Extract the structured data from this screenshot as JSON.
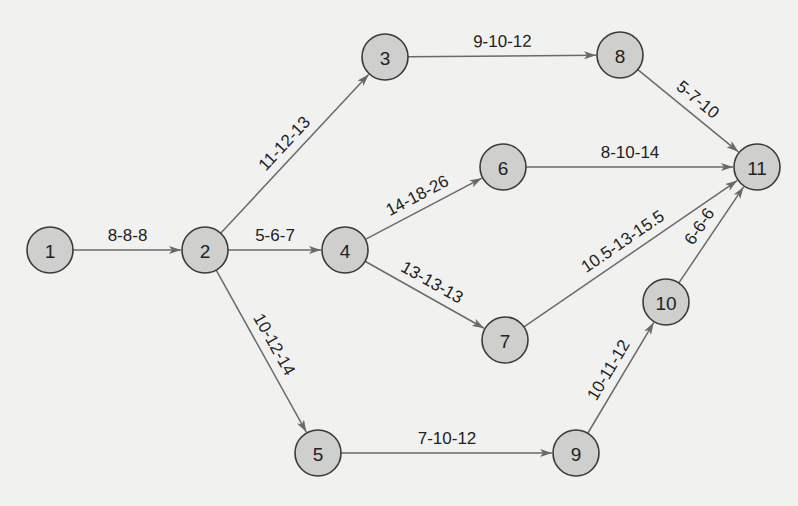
{
  "diagram": {
    "type": "activity-on-arrow network (PERT)",
    "colors": {
      "background": "#f1f1ef",
      "node_fill": "#cfcfcd",
      "node_stroke": "#3a3a3a",
      "edge": "#6a6a6a",
      "text": "#222222"
    },
    "node_radius": 23,
    "nodes": [
      {
        "id": "1",
        "label": "1",
        "x": 50,
        "y": 250
      },
      {
        "id": "2",
        "label": "2",
        "x": 205,
        "y": 250
      },
      {
        "id": "3",
        "label": "3",
        "x": 385,
        "y": 57
      },
      {
        "id": "4",
        "label": "4",
        "x": 345,
        "y": 250
      },
      {
        "id": "5",
        "label": "5",
        "x": 318,
        "y": 453
      },
      {
        "id": "6",
        "label": "6",
        "x": 503,
        "y": 167
      },
      {
        "id": "7",
        "label": "7",
        "x": 505,
        "y": 340
      },
      {
        "id": "8",
        "label": "8",
        "x": 620,
        "y": 55
      },
      {
        "id": "9",
        "label": "9",
        "x": 576,
        "y": 453
      },
      {
        "id": "10",
        "label": "10",
        "x": 666,
        "y": 302
      },
      {
        "id": "11",
        "label": "11",
        "x": 757,
        "y": 167
      }
    ],
    "edges": [
      {
        "from": "1",
        "to": "2",
        "label": "8-8-8"
      },
      {
        "from": "2",
        "to": "3",
        "label": "11-12-13"
      },
      {
        "from": "2",
        "to": "4",
        "label": "5-6-7"
      },
      {
        "from": "2",
        "to": "5",
        "label": "10-12-14"
      },
      {
        "from": "3",
        "to": "8",
        "label": "9-10-12"
      },
      {
        "from": "4",
        "to": "6",
        "label": "14-18-26"
      },
      {
        "from": "4",
        "to": "7",
        "label": "13-13-13"
      },
      {
        "from": "5",
        "to": "9",
        "label": "7-10-12"
      },
      {
        "from": "6",
        "to": "11",
        "label": "8-10-14"
      },
      {
        "from": "7",
        "to": "11",
        "label": "10.5-13-15.5"
      },
      {
        "from": "8",
        "to": "11",
        "label": "5-7-10"
      },
      {
        "from": "9",
        "to": "10",
        "label": "10-11-12"
      },
      {
        "from": "10",
        "to": "11",
        "label": "6-6-6"
      }
    ]
  }
}
